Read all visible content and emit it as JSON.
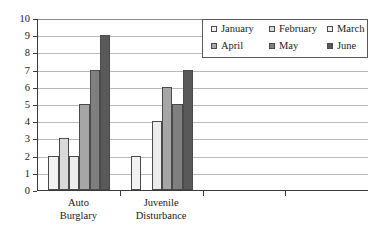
{
  "chart_data": {
    "type": "bar",
    "title": "",
    "xlabel": "",
    "ylabel": "",
    "ylim": [
      0,
      10
    ],
    "ytick_step": 1,
    "yticks": [
      "0",
      "1",
      "2",
      "3",
      "4",
      "5",
      "6",
      "7",
      "8",
      "9",
      "10"
    ],
    "grid": true,
    "legend_position": "top-right",
    "categories": [
      "Auto Burglary",
      "Juvenile Disturbance"
    ],
    "category_lines": [
      [
        "Auto",
        "Burglary"
      ],
      [
        "Juvenile",
        "Disturbance"
      ]
    ],
    "empty_category_slots": 2,
    "series": [
      {
        "name": "January",
        "color": "#f2f2f2",
        "values": [
          2,
          2
        ]
      },
      {
        "name": "February",
        "color": "#d9d9d9",
        "values": [
          3,
          0
        ]
      },
      {
        "name": "March",
        "color": "#ededed",
        "values": [
          2,
          4
        ]
      },
      {
        "name": "April",
        "color": "#a6a6a6",
        "values": [
          5,
          6
        ]
      },
      {
        "name": "May",
        "color": "#7f7f7f",
        "values": [
          7,
          5
        ]
      },
      {
        "name": "June",
        "color": "#595959",
        "values": [
          9,
          7
        ]
      }
    ]
  },
  "legend": {
    "items": [
      {
        "label": "January",
        "swatch": "#f2f2f2"
      },
      {
        "label": "February",
        "swatch": "#d9d9d9"
      },
      {
        "label": "March",
        "swatch": "#ededed"
      },
      {
        "label": "April",
        "swatch": "#a6a6a6"
      },
      {
        "label": "May",
        "swatch": "#7f7f7f"
      },
      {
        "label": "June",
        "swatch": "#595959"
      }
    ]
  },
  "colors": {
    "axis": "#3a3a3a",
    "grid": "#b9b9b9",
    "bar_border": "#4a4a4a",
    "background": "#ffffff"
  }
}
